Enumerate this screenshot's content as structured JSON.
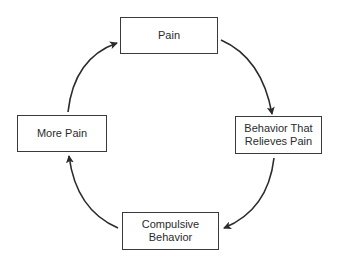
{
  "diagram": {
    "type": "cycle",
    "nodes": [
      {
        "id": "top",
        "label": "Pain"
      },
      {
        "id": "right",
        "label": "Behavior That\nRelieves Pain"
      },
      {
        "id": "bottom",
        "label": "Compulsive\nBehavior"
      },
      {
        "id": "left",
        "label": "More Pain"
      }
    ],
    "edges": [
      {
        "from": "Pain",
        "to": "Behavior That Relieves Pain",
        "direction": "clockwise"
      },
      {
        "from": "Behavior That Relieves Pain",
        "to": "Compulsive Behavior",
        "direction": "clockwise"
      },
      {
        "from": "Compulsive Behavior",
        "to": "More Pain",
        "direction": "clockwise"
      },
      {
        "from": "More Pain",
        "to": "Pain",
        "direction": "clockwise"
      }
    ],
    "colors": {
      "stroke": "#3a3a3a",
      "text": "#2b2b2b",
      "background": "#ffffff"
    }
  }
}
